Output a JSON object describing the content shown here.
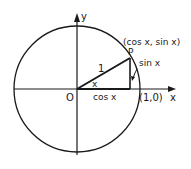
{
  "diagram": {
    "type": "unit-circle",
    "colors": {
      "stroke": "#1a1a1a",
      "background": "#ffffff"
    },
    "labels": {
      "y_axis": "y",
      "x_axis": "x",
      "origin": "O",
      "point_p": "P",
      "point_coords": "(cos x, sin x)",
      "radius": "1",
      "angle": "x",
      "adjacent": "cos x",
      "opposite": "sin x",
      "unit_point": "(1,0)"
    }
  }
}
